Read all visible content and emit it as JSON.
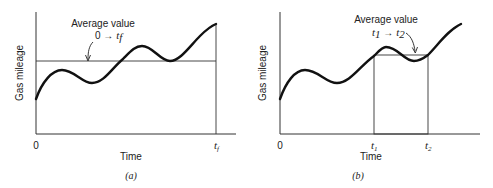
{
  "panels": [
    {
      "id": "a",
      "caption": "(a)",
      "ylabel": "Gas mileage",
      "xlabel": "Time",
      "x_start_label": "0",
      "x_end_label": "t",
      "x_end_sub": "f",
      "annotation_line1": "Average value",
      "annotation_line2_prefix": "0 → ",
      "annotation_line2_var": "t",
      "annotation_line2_sub": "f"
    },
    {
      "id": "b",
      "caption": "(b)",
      "ylabel": "Gas mileage",
      "xlabel": "Time",
      "x_start_label": "0",
      "t1_label": "t",
      "t1_sub": "1",
      "t2_label": "t",
      "t2_sub": "2",
      "annotation_line1": "Average value",
      "annotation_var1": "t",
      "annotation_sub1": "1",
      "annotation_arrow": " → ",
      "annotation_var2": "t",
      "annotation_sub2": "2"
    }
  ]
}
